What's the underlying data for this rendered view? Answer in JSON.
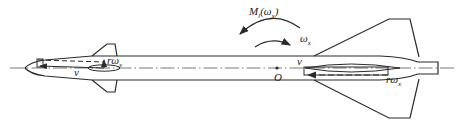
{
  "diagram": {
    "colors": {
      "stroke": "#2a2a2a",
      "background": "#ffffff"
    },
    "labels": {
      "moment": {
        "main": "M",
        "sub_l": "l",
        "paren_open": "(",
        "omega": "ω",
        "sub_x": "x",
        "paren_close": ")"
      },
      "angular_velocity": {
        "main": "ω",
        "sub": "x"
      },
      "origin": "O",
      "velocity_rear": "v",
      "velocity_front": "v",
      "rear_tangential": {
        "r": "r",
        "omega": "ω",
        "sub": "x"
      },
      "front_tangential": {
        "r": "r",
        "omega": "ω",
        "sub": "x"
      }
    },
    "arrows": [
      {
        "name": "moment-arrow",
        "direction": "counter-clockwise",
        "label": "M_l(ω_x)"
      },
      {
        "name": "angular-velocity-arrow",
        "direction": "clockwise",
        "label": "ω_x"
      }
    ],
    "parts": [
      "nose",
      "body",
      "forward-fins",
      "rear-fins",
      "tail",
      "centerline"
    ]
  }
}
